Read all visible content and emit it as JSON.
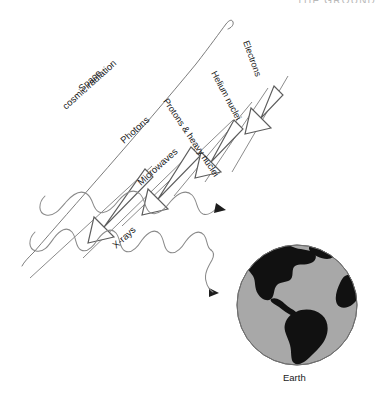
{
  "page": {
    "header_text": "THE GROUND",
    "background_color": "#ffffff"
  },
  "diagram": {
    "labels": {
      "source_line1": "Space",
      "source_line2": "cosmic radiation",
      "photons": "Photons",
      "microwaves": "Microwaves",
      "xrays": "X-rays",
      "protons": "Protons & heavy nuclei",
      "helium": "Helium nuclei",
      "electrons": "Electrons",
      "earth": "Earth"
    },
    "radiation_types": [
      {
        "name": "Photons",
        "form": "wave",
        "count": 2
      },
      {
        "name": "Microwaves",
        "form": "wave"
      },
      {
        "name": "X-rays",
        "form": "wave"
      },
      {
        "name": "Protons & heavy nuclei",
        "form": "arrow"
      },
      {
        "name": "Helium nuclei",
        "form": "arrow"
      },
      {
        "name": "Electrons",
        "form": "arrow"
      }
    ],
    "arrow_count": 4,
    "wave_count": 2,
    "colors": {
      "globe_ocean": "#a8a8a8",
      "globe_land": "#111111",
      "globe_outline": "#6f6f6f",
      "line": "#6d6d6d",
      "wave": "#8a8a8a",
      "text": "#1a1a1a",
      "header": "#b9b9b9"
    },
    "earth": {
      "label": "Earth",
      "center_x": 297,
      "center_y": 305,
      "radius": 60
    }
  }
}
